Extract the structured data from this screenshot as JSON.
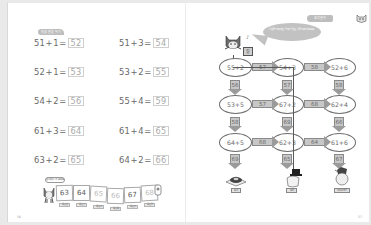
{
  "left_page": {
    "header_pill": "덧셈 연습 하기",
    "equations": [
      {
        "a": "51",
        "op": "+",
        "b": "1",
        "ans": "52"
      },
      {
        "a": "51",
        "op": "+",
        "b": "3",
        "ans": "54"
      },
      {
        "a": "52",
        "op": "+",
        "b": "1",
        "ans": "53"
      },
      {
        "a": "53",
        "op": "+",
        "b": "2",
        "ans": "55"
      },
      {
        "a": "54",
        "op": "+",
        "b": "2",
        "ans": "56"
      },
      {
        "a": "55",
        "op": "+",
        "b": "4",
        "ans": "59"
      },
      {
        "a": "61",
        "op": "+",
        "b": "3",
        "ans": "64"
      },
      {
        "a": "61",
        "op": "+",
        "b": "4",
        "ans": "65"
      },
      {
        "a": "63",
        "op": "+",
        "b": "2",
        "ans": "65"
      },
      {
        "a": "64",
        "op": "+",
        "b": "2",
        "ans": "66"
      }
    ],
    "equals": "=",
    "strip_bubble": "순서대로 써 보세요",
    "strip": {
      "cells": [
        "63",
        "64",
        "65",
        "66",
        "67",
        "68"
      ],
      "tags": [
        "육십삼",
        "육십사",
        "육십오",
        "육십육",
        "육십칠",
        "육십팔"
      ]
    },
    "page_number": "56"
  },
  "right_page": {
    "header_pill": "생각 놀이",
    "speech_bubble": "덧셈을 하여 계산 결과가 맞는 길을 따라가 보세요.",
    "sign_label": "길",
    "nodes": [
      [
        "55+2",
        "54+3",
        "52+6"
      ],
      [
        "53+5",
        "67+2",
        "62+4"
      ],
      [
        "64+5",
        "62+3",
        "61+6"
      ]
    ],
    "h_arrows": [
      [
        "57",
        "58"
      ],
      [
        "57",
        "68"
      ],
      [
        "68",
        "64"
      ]
    ],
    "v_arrows": [
      [
        "56",
        "57",
        "58"
      ],
      [
        "58",
        "69",
        "66"
      ],
      [
        "69",
        "65",
        "67"
      ]
    ],
    "destinations": [
      "도넛",
      "모자",
      "아이스크림"
    ],
    "page_number": "57"
  },
  "colors": {
    "text": "#6a6a6a",
    "answer": "#a9a9a9",
    "arrow_fill": "#c7c7c7",
    "bubble": "#c2c2c2"
  }
}
